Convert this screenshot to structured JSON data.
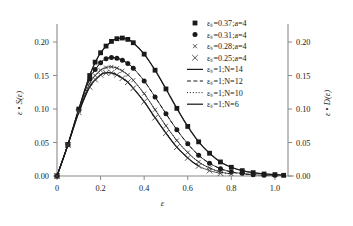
{
  "chart_data": {
    "type": "line",
    "title": "",
    "xlabel": "ε",
    "ylabel": "ε • S(ε)",
    "y2label": "ε • D(ε)",
    "xlim": [
      0.0,
      1.06
    ],
    "ylim": [
      0.0,
      0.218
    ],
    "y2lim": [
      0.0,
      0.218
    ],
    "xticks": [
      0,
      0.2,
      0.4,
      0.6,
      0.8,
      1.0
    ],
    "xticklabels": [
      "0",
      "0.2",
      "0.4",
      "0.6",
      "0.8",
      "1.0"
    ],
    "yticks": [
      0.0,
      0.05,
      0.1,
      0.15,
      0.2
    ],
    "yticklabels": [
      "0.00",
      "0.05",
      "0.10",
      "0.15",
      "0.20"
    ],
    "y2ticks": [
      0.0,
      0.05,
      0.1,
      0.15,
      0.2
    ],
    "y2ticklabels": [
      "0.00",
      "0.05",
      "0.10",
      "0.15",
      "0.20"
    ],
    "grid": false,
    "legend_position": "upper right",
    "series": [
      {
        "name": "εₛ=0.37;a=4",
        "marker": "filled-square",
        "style": "markers",
        "x": [
          0.0,
          0.05,
          0.1,
          0.15,
          0.175,
          0.2,
          0.225,
          0.25,
          0.275,
          0.3,
          0.325,
          0.35,
          0.4,
          0.45,
          0.5,
          0.55,
          0.6,
          0.65,
          0.7,
          0.75,
          0.8,
          0.85,
          0.9,
          0.95,
          1.0,
          1.04
        ],
        "y": [
          0.0,
          0.047,
          0.1,
          0.15,
          0.17,
          0.184,
          0.194,
          0.201,
          0.205,
          0.206,
          0.204,
          0.199,
          0.182,
          0.158,
          0.13,
          0.101,
          0.074,
          0.051,
          0.034,
          0.021,
          0.013,
          0.008,
          0.005,
          0.003,
          0.002,
          0.001
        ]
      },
      {
        "name": "εₛ=0.31;a=4",
        "marker": "filled-circle",
        "style": "markers",
        "x": [
          0.0,
          0.05,
          0.1,
          0.15,
          0.175,
          0.2,
          0.225,
          0.25,
          0.275,
          0.3,
          0.325,
          0.35,
          0.4,
          0.45,
          0.5,
          0.55,
          0.6,
          0.65,
          0.7,
          0.75,
          0.8,
          0.85,
          0.9,
          0.95,
          1.0
        ],
        "y": [
          0.0,
          0.047,
          0.099,
          0.145,
          0.159,
          0.169,
          0.175,
          0.177,
          0.176,
          0.173,
          0.168,
          0.161,
          0.142,
          0.118,
          0.093,
          0.069,
          0.048,
          0.031,
          0.019,
          0.011,
          0.006,
          0.004,
          0.002,
          0.001,
          0.001
        ]
      },
      {
        "name": "εₛ=0.28;a=4",
        "marker": "small-cross",
        "style": "markers",
        "x": [
          0.0,
          0.05,
          0.1,
          0.15,
          0.175,
          0.2,
          0.225,
          0.25,
          0.275,
          0.3,
          0.325,
          0.35,
          0.4,
          0.45,
          0.5,
          0.55,
          0.6,
          0.65,
          0.7,
          0.75,
          0.8
        ],
        "y": [
          0.0,
          0.047,
          0.097,
          0.138,
          0.15,
          0.158,
          0.162,
          0.163,
          0.161,
          0.157,
          0.151,
          0.143,
          0.123,
          0.099,
          0.075,
          0.053,
          0.035,
          0.021,
          0.012,
          0.006,
          0.003
        ]
      },
      {
        "name": "εₛ=0.25;a=4",
        "marker": "cross",
        "style": "markers",
        "x": [
          0.0,
          0.05,
          0.1,
          0.15,
          0.175,
          0.2,
          0.225,
          0.25,
          0.275,
          0.3,
          0.325,
          0.35,
          0.4,
          0.45,
          0.5,
          0.55,
          0.6,
          0.65,
          0.7,
          0.75
        ],
        "y": [
          0.0,
          0.046,
          0.095,
          0.133,
          0.144,
          0.151,
          0.154,
          0.154,
          0.151,
          0.146,
          0.14,
          0.131,
          0.111,
          0.087,
          0.064,
          0.043,
          0.027,
          0.015,
          0.008,
          0.004
        ]
      },
      {
        "name": "εₛ=1;N=14",
        "marker": "none",
        "style": "solid",
        "linewidth": 1.25,
        "x": [
          0.0,
          0.05,
          0.1,
          0.15,
          0.2,
          0.25,
          0.275,
          0.3,
          0.325,
          0.35,
          0.4,
          0.45,
          0.5,
          0.55,
          0.6,
          0.65,
          0.7,
          0.75,
          0.8,
          0.85,
          0.9,
          0.95,
          1.0,
          1.05
        ],
        "y": [
          0.0,
          0.047,
          0.1,
          0.15,
          0.184,
          0.201,
          0.205,
          0.206,
          0.204,
          0.199,
          0.182,
          0.158,
          0.13,
          0.101,
          0.074,
          0.051,
          0.034,
          0.021,
          0.013,
          0.008,
          0.005,
          0.003,
          0.002,
          0.001
        ]
      },
      {
        "name": "εₛ=1;N=12",
        "marker": "none",
        "style": "dashed",
        "linewidth": 1.0,
        "x": [
          0.0,
          0.05,
          0.1,
          0.15,
          0.2,
          0.225,
          0.25,
          0.275,
          0.3,
          0.325,
          0.35,
          0.4,
          0.45,
          0.5,
          0.55,
          0.6,
          0.65,
          0.7,
          0.75,
          0.8,
          0.85,
          0.9
        ],
        "y": [
          0.0,
          0.047,
          0.099,
          0.145,
          0.169,
          0.175,
          0.177,
          0.176,
          0.173,
          0.168,
          0.161,
          0.142,
          0.118,
          0.093,
          0.069,
          0.048,
          0.031,
          0.019,
          0.011,
          0.006,
          0.003,
          0.002
        ]
      },
      {
        "name": "εₛ=1;N=10",
        "marker": "none",
        "style": "dotted",
        "linewidth": 1.0,
        "x": [
          0.0,
          0.05,
          0.1,
          0.15,
          0.2,
          0.225,
          0.25,
          0.275,
          0.3,
          0.325,
          0.35,
          0.4,
          0.45,
          0.5,
          0.55,
          0.6,
          0.65,
          0.7,
          0.75,
          0.8
        ],
        "y": [
          0.0,
          0.047,
          0.097,
          0.138,
          0.158,
          0.162,
          0.163,
          0.161,
          0.157,
          0.151,
          0.143,
          0.123,
          0.099,
          0.075,
          0.053,
          0.035,
          0.021,
          0.012,
          0.006,
          0.003
        ]
      },
      {
        "name": "εₛ=1;N=6",
        "marker": "none",
        "style": "solid",
        "linewidth": 1.25,
        "x": [
          0.0,
          0.05,
          0.1,
          0.15,
          0.2,
          0.225,
          0.25,
          0.275,
          0.3,
          0.325,
          0.35,
          0.4,
          0.45,
          0.5,
          0.55,
          0.6,
          0.625,
          0.65
        ],
        "y": [
          0.0,
          0.046,
          0.095,
          0.133,
          0.151,
          0.154,
          0.154,
          0.151,
          0.146,
          0.14,
          0.131,
          0.111,
          0.087,
          0.064,
          0.043,
          0.027,
          0.02,
          0.015
        ]
      }
    ]
  },
  "legend": {
    "entries": [
      {
        "label": "εₛ=0.37;a=4",
        "kind": "filled-square"
      },
      {
        "label": "εₛ=0.31;a=4",
        "kind": "filled-circle"
      },
      {
        "label": "εₛ=0.28;a=4",
        "kind": "small-cross"
      },
      {
        "label": "εₛ=0.25;a=4",
        "kind": "cross"
      },
      {
        "label": "εₛ=1;N=14",
        "kind": "solid"
      },
      {
        "label": "εₛ=1;N=12",
        "kind": "dashed"
      },
      {
        "label": "εₛ=1;N=10",
        "kind": "dotted"
      },
      {
        "label": "εₛ=1;N=6",
        "kind": "solid"
      }
    ]
  },
  "colors": {
    "ink": "#1a1a1a",
    "axis": "#8a8a8a",
    "background": "#ffffff"
  }
}
